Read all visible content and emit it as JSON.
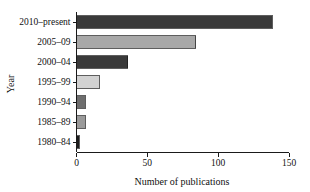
{
  "chart_data": {
    "type": "bar",
    "orientation": "horizontal",
    "title": "",
    "xlabel": "Number of publications",
    "ylabel": "Year",
    "xlim": [
      0,
      150
    ],
    "xticks": [
      0,
      50,
      100,
      150
    ],
    "xtick_labels": [
      "0",
      "50",
      "100",
      "150"
    ],
    "grid": false,
    "legend": false,
    "categories": [
      "1980–84",
      "1985–89",
      "1990–94",
      "1995–99",
      "2000–04",
      "2005–09",
      "2010–present"
    ],
    "values": [
      2,
      6,
      6,
      16,
      36,
      84,
      138
    ],
    "bar_colors": [
      "#1c1c1c",
      "#9a9a9a",
      "#6e6e6e",
      "#d2d2d2",
      "#3a3a3a",
      "#a8a8a8",
      "#3a3a3a"
    ],
    "bar_edge_color": "#1a1a1a"
  }
}
